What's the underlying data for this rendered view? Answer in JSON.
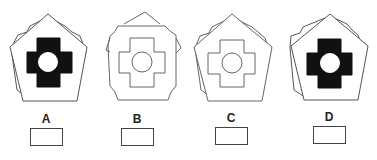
{
  "puzzle": {
    "options": [
      {
        "label": "A",
        "fill": "#111111",
        "variant": "pentagon-rotated"
      },
      {
        "label": "B",
        "fill": "none",
        "variant": "octagon-notched"
      },
      {
        "label": "C",
        "fill": "none",
        "variant": "pentagon-rotated"
      },
      {
        "label": "D",
        "fill": "#111111",
        "variant": "pentagon-rotated"
      }
    ],
    "stroke_color": "#555555",
    "answer_boxes": [
      "",
      "",
      "",
      ""
    ]
  }
}
